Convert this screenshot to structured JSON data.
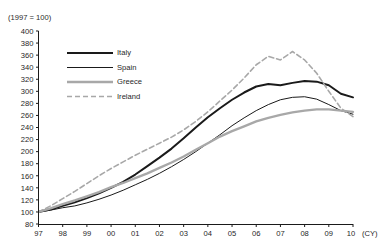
{
  "header": {
    "cropped_title": "",
    "unit_note": "(1997 = 100)"
  },
  "axis": {
    "x_unit_label": "(CY)",
    "y_ticks": [
      "80",
      "100",
      "120",
      "140",
      "160",
      "180",
      "200",
      "220",
      "240",
      "260",
      "280",
      "300",
      "320",
      "340",
      "360",
      "380",
      "400"
    ],
    "x_ticks": [
      "97",
      "98",
      "99",
      "00",
      "01",
      "02",
      "03",
      "04",
      "05",
      "06",
      "07",
      "08",
      "09",
      "10"
    ]
  },
  "legend": {
    "items": [
      {
        "label": "Italy",
        "color": "#1a1a1a",
        "width": 2.0,
        "dash": "none"
      },
      {
        "label": "Spain",
        "color": "#1a1a1a",
        "width": 1.0,
        "dash": "none"
      },
      {
        "label": "Greece",
        "color": "#a8a8a8",
        "width": 2.4,
        "dash": "none"
      },
      {
        "label": "Ireland",
        "color": "#a8a8a8",
        "width": 1.6,
        "dash": "5,3"
      }
    ]
  },
  "chart_data": {
    "type": "line",
    "title": "",
    "subtitle": "(1997 = 100)",
    "xlabel": "(CY)",
    "ylabel": "",
    "xlim": [
      1997,
      2010
    ],
    "ylim": [
      80,
      400
    ],
    "y_tick_step": 20,
    "grid": false,
    "legend_position": "top-left",
    "x": [
      1997,
      1997.5,
      1998,
      1998.5,
      1999,
      1999.5,
      2000,
      2000.5,
      2001,
      2001.5,
      2002,
      2002.5,
      2003,
      2003.5,
      2004,
      2004.5,
      2005,
      2005.5,
      2006,
      2006.5,
      2007,
      2007.5,
      2008,
      2008.5,
      2009,
      2009.5,
      2010
    ],
    "series": [
      {
        "name": "Italy",
        "color": "#1a1a1a",
        "values": [
          100,
          104,
          110,
          116,
          123,
          131,
          140,
          150,
          162,
          176,
          190,
          205,
          222,
          240,
          257,
          272,
          286,
          298,
          308,
          312,
          310,
          314,
          317,
          316,
          310,
          296,
          290
        ]
      },
      {
        "name": "Spain",
        "color": "#1a1a1a",
        "values": [
          100,
          103,
          107,
          110,
          115,
          121,
          128,
          136,
          145,
          154,
          164,
          175,
          187,
          200,
          214,
          228,
          243,
          256,
          268,
          278,
          286,
          290,
          291,
          287,
          278,
          268,
          262
        ]
      },
      {
        "name": "Greece",
        "color": "#a8a8a8",
        "values": [
          100,
          106,
          113,
          119,
          126,
          133,
          141,
          148,
          156,
          164,
          173,
          182,
          192,
          203,
          214,
          225,
          234,
          242,
          250,
          256,
          261,
          265,
          268,
          270,
          270,
          268,
          266
        ]
      },
      {
        "name": "Ireland",
        "color": "#a8a8a8",
        "values": [
          100,
          110,
          122,
          134,
          147,
          160,
          172,
          183,
          194,
          204,
          214,
          224,
          236,
          250,
          266,
          284,
          302,
          322,
          344,
          358,
          352,
          366,
          352,
          330,
          300,
          272,
          258
        ]
      }
    ]
  }
}
